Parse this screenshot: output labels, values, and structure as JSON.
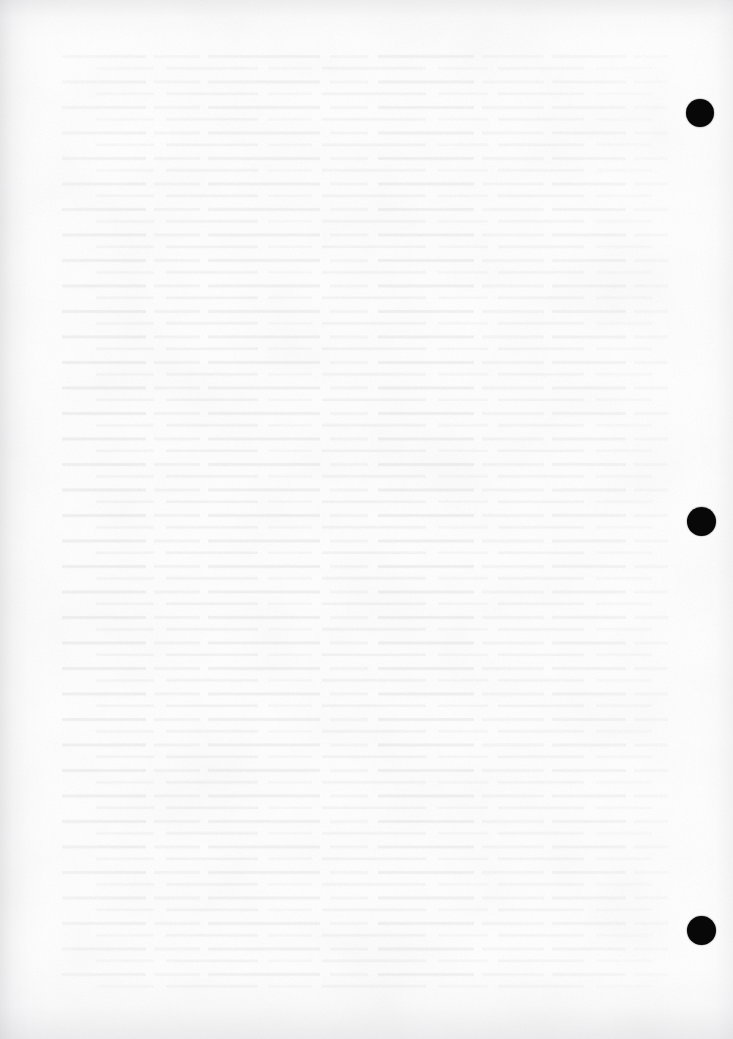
{
  "page": {
    "kind": "scanned-blank-page",
    "width": 733,
    "height": 1039,
    "background_color": "#fdfdfd",
    "paper_tone": "#ffffff",
    "visible_text": "",
    "note_label": "",
    "description_label": ""
  },
  "marks": {
    "ink_color": "#080808",
    "shape": "circle",
    "count": 3,
    "items": [
      {
        "id": "registration-mark-top",
        "cx": 700,
        "cy": 113,
        "d": 28,
        "label": ""
      },
      {
        "id": "registration-mark-middle",
        "cx": 701,
        "cy": 521,
        "d": 29,
        "label": ""
      },
      {
        "id": "registration-mark-bottom",
        "cx": 701,
        "cy": 930,
        "d": 29,
        "label": ""
      }
    ]
  },
  "texture": {
    "grain_opacity": 0.55,
    "bleed_opacity": 0.3,
    "edge_shadow_color": "#bebec3"
  }
}
